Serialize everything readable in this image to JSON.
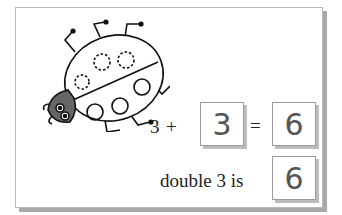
{
  "illustration": {
    "subject": "ladybird",
    "spots_dashed": 3,
    "spots_solid": 3
  },
  "equation": {
    "addend": "3",
    "plus": "+",
    "answer_addend": "3",
    "equals": "=",
    "sum": "6"
  },
  "double": {
    "label": "double 3 is",
    "answer": "6"
  }
}
